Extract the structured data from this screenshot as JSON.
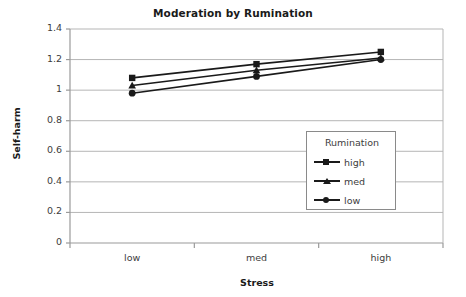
{
  "chart_data": {
    "type": "line",
    "title": "Moderation by Rumination",
    "xlabel": "Stress",
    "ylabel": "Self-harm",
    "categories": [
      "low",
      "med",
      "high"
    ],
    "ylim": [
      0,
      1.4
    ],
    "yticks": [
      "0",
      "0.2",
      "0.4",
      "0.6",
      "0.8",
      "1",
      "1.2",
      "1.4"
    ],
    "ytick_values": [
      0,
      0.2,
      0.4,
      0.6,
      0.8,
      1,
      1.2,
      1.4
    ],
    "grid": "horizontal",
    "legend_position": "inside-right",
    "legend_title": "Rumination",
    "series": [
      {
        "name": "high",
        "marker": "square",
        "values": [
          1.08,
          1.17,
          1.25
        ]
      },
      {
        "name": "med",
        "marker": "triangle",
        "values": [
          1.03,
          1.13,
          1.21
        ]
      },
      {
        "name": "low",
        "marker": "circle",
        "values": [
          0.98,
          1.09,
          1.2
        ]
      }
    ],
    "colors": {
      "line": "#1a1a1a",
      "grid": "#b5b5b5",
      "axis": "#9a9a9a",
      "background": "#ffffff"
    }
  }
}
